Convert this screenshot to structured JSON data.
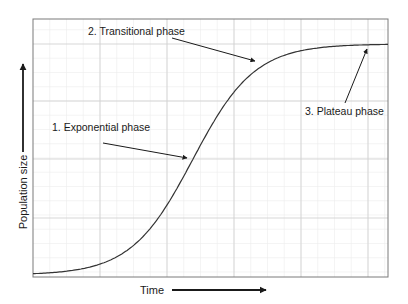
{
  "chart_data": {
    "type": "line",
    "title": "",
    "xlabel": "Time",
    "ylabel": "Population size",
    "grid": true,
    "xlim": [
      0,
      10
    ],
    "ylim": [
      0,
      1.1
    ],
    "series": [
      {
        "name": "Logistic population growth",
        "x": [
          0,
          0.5,
          1,
          1.5,
          2,
          2.5,
          3,
          3.5,
          4,
          4.5,
          5,
          5.5,
          6,
          6.5,
          7,
          7.5,
          8,
          8.5,
          9,
          9.5,
          10
        ],
        "values": [
          0.01,
          0.02,
          0.03,
          0.05,
          0.09,
          0.15,
          0.26,
          0.41,
          0.58,
          0.74,
          0.86,
          0.93,
          0.97,
          0.985,
          0.993,
          0.997,
          0.999,
          1.0,
          1.0,
          1.0,
          1.0
        ]
      }
    ],
    "annotations": [
      {
        "id": "exponential",
        "text": "1. Exponential phase",
        "label_pos": [
          52,
          131
        ],
        "arrow_from": [
          103,
          143
        ],
        "arrow_to": [
          187,
          158
        ]
      },
      {
        "id": "transitional",
        "text": "2. Transitional phase",
        "label_pos": [
          88,
          35
        ],
        "arrow_from": [
          172,
          38
        ],
        "arrow_to": [
          255,
          61
        ]
      },
      {
        "id": "plateau",
        "text": "3. Plateau phase",
        "label_pos": [
          305,
          115
        ],
        "arrow_from": [
          345,
          103
        ],
        "arrow_to": [
          367,
          49
        ]
      }
    ],
    "axis_arrows": {
      "y": {
        "x": 23,
        "from_y": 152,
        "to_y": 64
      },
      "x": {
        "y": 290,
        "from_x": 172,
        "to_x": 266
      }
    }
  },
  "plot": {
    "left": 33,
    "top": 19,
    "right": 388,
    "bottom": 277,
    "major_x": [
      33,
      100,
      167,
      234,
      301,
      368
    ],
    "major_y": [
      44,
      101,
      159,
      218
    ],
    "colors": {
      "frame": "#7a7a7a",
      "grid_major": "#d2d2d2",
      "grid_minor": "#ececec",
      "curve": "#333333",
      "text": "#1a1a1a"
    }
  },
  "labels": {
    "exponential": "1. Exponential phase",
    "transitional": "2. Transitional phase",
    "plateau": "3. Plateau phase",
    "x_axis": "Time",
    "y_axis": "Population size"
  }
}
